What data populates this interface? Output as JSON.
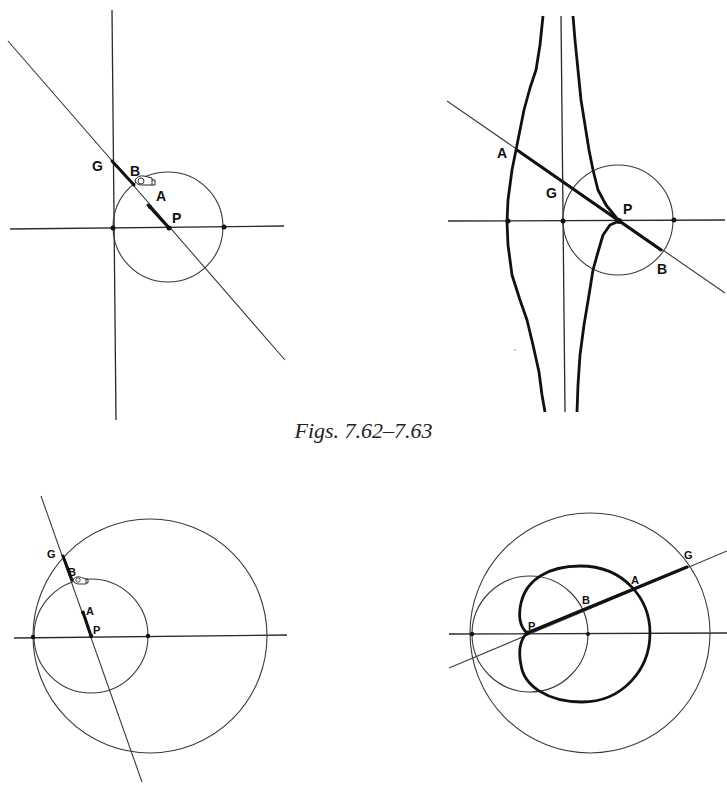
{
  "caption": "Figs. 7.62–7.63",
  "figures": [
    {
      "id": "fig-7-62-a",
      "labels": {
        "G": "G",
        "B": "B",
        "A": "A",
        "P": "P"
      },
      "elements": [
        "horizontal axis",
        "vertical axis",
        "circle",
        "secant line through P",
        "thick segment G-B",
        "thick segment A-P",
        "hand cursor at B"
      ]
    },
    {
      "id": "fig-7-62-b",
      "labels": {
        "A": "A",
        "G": "G",
        "P": "P",
        "B": "B"
      },
      "elements": [
        "horizontal axis",
        "vertical axis",
        "circle",
        "secant line",
        "thick segment A-B",
        "heavy locus curves (conchoid-like)"
      ]
    },
    {
      "id": "fig-7-63-a",
      "labels": {
        "G": "G",
        "B": "B",
        "A": "A",
        "P": "P"
      },
      "elements": [
        "horizontal axis",
        "small circle",
        "large circle",
        "secant line through P",
        "thick segment G-B",
        "thick segment A-P",
        "hand cursor at B"
      ]
    },
    {
      "id": "fig-7-63-b",
      "labels": {
        "P": "P",
        "B": "B",
        "A": "A",
        "G": "G"
      },
      "elements": [
        "horizontal axis",
        "small circle",
        "large circle",
        "secant line through P",
        "thick segment P-G",
        "heavy locus curve (limaçon/cardioid-like)"
      ]
    }
  ]
}
